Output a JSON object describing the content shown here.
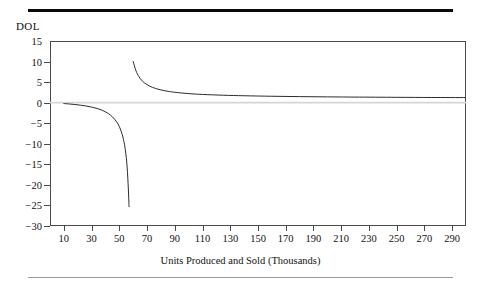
{
  "figure": {
    "name": "degree-of-operating-leverage-chart",
    "y_axis_title": "DOL",
    "x_axis_title": "Units Produced and Sold (Thousands)"
  },
  "chart_data": {
    "type": "line",
    "title": "",
    "subtitle": "",
    "xlabel": "Units Produced and Sold (Thousands)",
    "ylabel": "DOL",
    "xlim": [
      0,
      300
    ],
    "ylim": [
      -30,
      15
    ],
    "xticks": [
      10,
      30,
      50,
      70,
      90,
      110,
      130,
      150,
      170,
      190,
      210,
      230,
      250,
      270,
      290
    ],
    "yticks": [
      15,
      10,
      5,
      0,
      -5,
      -10,
      -15,
      -20,
      -25,
      -30
    ],
    "grid": false,
    "legend": null,
    "annotations": [
      {
        "text": "vertical asymptote at break-even volume",
        "x": 58,
        "y": 0
      },
      {
        "text": "horizontal asymptote at DOL = 1",
        "x": 300,
        "y": 1
      }
    ],
    "reference_lines": [
      {
        "axis": "y",
        "value": 0,
        "color": "#d5d5d5"
      }
    ],
    "series": [
      {
        "name": "DOL below break-even",
        "color": "#2b2b2b",
        "x": [
          10,
          14,
          18,
          22,
          26,
          30,
          34,
          38,
          42,
          45,
          48,
          50,
          52,
          53,
          54,
          55,
          55.6,
          56.1,
          56.5,
          56.8,
          57.0
        ],
        "y": [
          -0.21,
          -0.32,
          -0.45,
          -0.61,
          -0.81,
          -1.07,
          -1.42,
          -1.9,
          -2.63,
          -3.46,
          -4.64,
          -5.8,
          -7.67,
          -9.0,
          -10.75,
          -13.33,
          -15.6,
          -18.3,
          -21.0,
          -23.4,
          -25.3
        ]
      },
      {
        "name": "DOL above break-even",
        "color": "#2b2b2b",
        "x": [
          60,
          62,
          64,
          66,
          68,
          72,
          76,
          80,
          85,
          90,
          100,
          110,
          125,
          140,
          160,
          180,
          200,
          220,
          250,
          275,
          300
        ],
        "y": [
          10.0,
          7.75,
          6.4,
          5.5,
          4.85,
          4.0,
          3.47,
          3.1,
          2.77,
          2.53,
          2.2,
          2.0,
          1.81,
          1.68,
          1.56,
          1.47,
          1.41,
          1.36,
          1.3,
          1.26,
          1.24
        ]
      }
    ]
  },
  "y_tick_labels": [
    "15",
    "10",
    "5",
    "0",
    "-5",
    "-10",
    "-15",
    "-20",
    "-25",
    "-30"
  ],
  "x_tick_labels": [
    "10",
    "30",
    "50",
    "70",
    "90",
    "110",
    "130",
    "150",
    "170",
    "190",
    "210",
    "230",
    "250",
    "270",
    "290"
  ]
}
